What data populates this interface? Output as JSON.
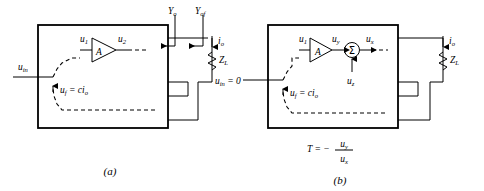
{
  "figure": {
    "line_color": "#000000",
    "background_color": "#ffffff"
  },
  "panels": [
    {
      "id": "a",
      "caption": "(a)",
      "input_label": "u",
      "input_sub": "in",
      "input_suffix": "",
      "amplifier_label": "A",
      "amp_in_label": "u",
      "amp_in_sub": "1",
      "amp_out_label": "u",
      "amp_out_sub": "2",
      "feedback_label": "u",
      "feedback_sub": "f",
      "feedback_eq": " = ci",
      "feedback_eq_sub": "o",
      "current_label": "i",
      "current_sub": "o",
      "load_label": "Z",
      "load_sub": "L",
      "admittance_1": "Y",
      "admittance_1_sub": "o",
      "admittance_2": "Y",
      "admittance_2_sub": "of"
    },
    {
      "id": "b",
      "caption": "(b)",
      "input_label": "u",
      "input_sub": "in",
      "input_suffix": " = 0",
      "amplifier_label": "A",
      "amp_in_label": "u",
      "amp_in_sub": "1",
      "amp_out_label": "u",
      "amp_out_sub": "y",
      "summer_label": "Σ",
      "summer_out_label": "u",
      "summer_out_sub": "x",
      "summer_inject_label": "u",
      "summer_inject_sub": "z",
      "feedback_label": "u",
      "feedback_sub": "f",
      "feedback_eq": " = ci",
      "feedback_eq_sub": "o",
      "current_label": "i",
      "current_sub": "o",
      "load_label": "Z",
      "load_sub": "L",
      "formula": {
        "lhs": "T",
        "eq": " = −",
        "num": "u",
        "num_sub": "y",
        "den": "u",
        "den_sub": "x"
      }
    }
  ]
}
